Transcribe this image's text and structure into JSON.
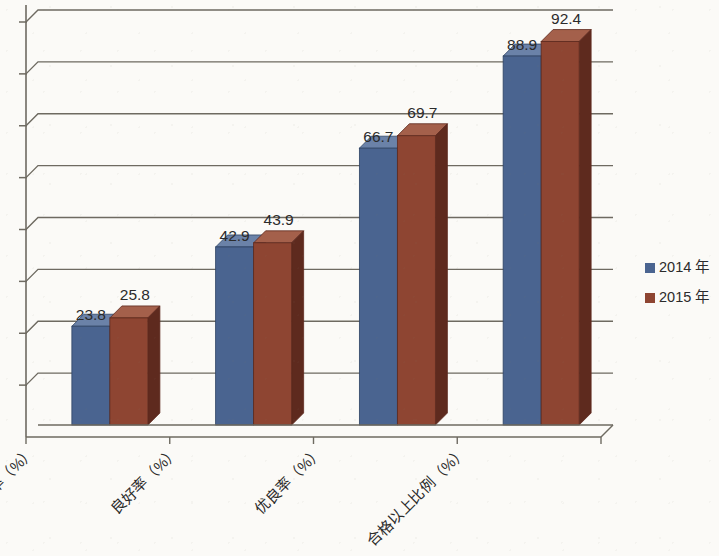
{
  "chart_data": {
    "type": "bar",
    "title": "",
    "subtitle": "",
    "xlabel": "",
    "ylabel": "",
    "grid": true,
    "legend_position": "right",
    "ylim": [
      0,
      100
    ],
    "ytick_labels": [],
    "gridline_count": 8,
    "categories": [
      "优秀率（%）",
      "良好率（%）",
      "优良率（%）",
      "合格以上比例（%）"
    ],
    "series": [
      {
        "name": "2014 年",
        "color": "#4a6490",
        "values": [
          23.8,
          42.9,
          66.7,
          88.9
        ],
        "value_labels": [
          "23.8",
          "42.9",
          "66.7",
          "88.9"
        ]
      },
      {
        "name": "2015 年",
        "color": "#8e4532",
        "values": [
          25.8,
          43.9,
          69.7,
          92.4
        ],
        "value_labels": [
          "25.8",
          "43.9",
          "69.7",
          "92.4"
        ]
      }
    ]
  },
  "legend": {
    "items": [
      {
        "label": "2014 年",
        "color": "#4a6490"
      },
      {
        "label": "2015 年",
        "color": "#8e4532"
      }
    ]
  },
  "colors": {
    "series_2014_front": "#4a6490",
    "series_2014_side": "#2f4464",
    "series_2014_top": "#6b82a8",
    "series_2015_front": "#8e4532",
    "series_2015_side": "#5e2a1e",
    "series_2015_top": "#a4604b",
    "axis": "#6e6a61",
    "grid": "#6e6a61",
    "background": "#fbfaf7",
    "text": "#2b2b2b"
  },
  "axes": {
    "y_axis_visible": true,
    "x_axis_visible": true,
    "tick_marks": 8
  }
}
